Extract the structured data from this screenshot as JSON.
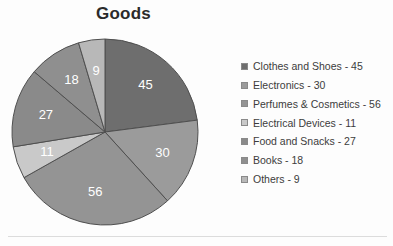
{
  "chart_data": {
    "type": "pie",
    "title": "Goods",
    "xlabel": "",
    "ylabel": "",
    "total": 196,
    "legend_position": "right",
    "grid": false,
    "start_angle_deg": 0,
    "direction": "clockwise",
    "categories": [
      "Clothes and Shoes",
      "Electronics",
      "Perfumes & Cosmetics",
      "Electrical Devices",
      "Food and Snacks",
      "Books",
      "Others"
    ],
    "values": [
      45,
      30,
      56,
      11,
      27,
      18,
      9
    ],
    "slice_labels": [
      "45",
      "30",
      "56",
      "11",
      "27",
      "18",
      "9"
    ],
    "colors": [
      "#6e6e6e",
      "#9b9b9b",
      "#949494",
      "#c9c9c9",
      "#8a8a8a",
      "#8f8f8f",
      "#b8b8b8"
    ],
    "legend_entries": [
      "Clothes and Shoes - 45",
      "Electronics - 30",
      "Perfumes & Cosmetics - 56",
      "Electrical Devices - 11",
      "Food and Snacks - 27",
      "Books - 18",
      "Others - 9"
    ]
  },
  "style": {
    "slice_border_color": "#4f4f4f",
    "slice_label_color": "#ffffff",
    "title_color": "#2b2b2b",
    "legend_text_color": "#3c3c3c",
    "background": "#fdfdfd"
  }
}
